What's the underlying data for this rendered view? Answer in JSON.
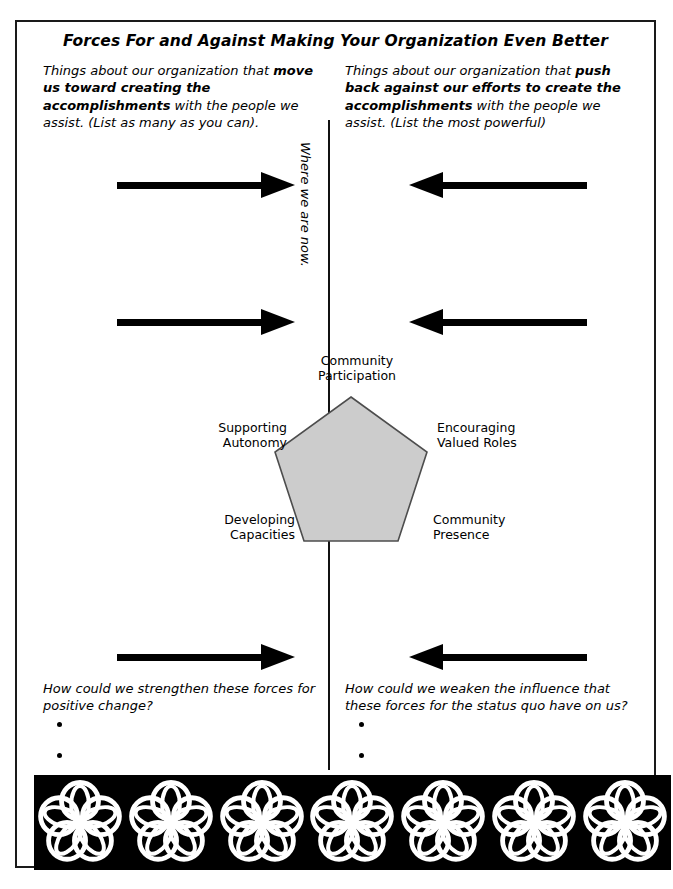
{
  "page": {
    "title": "Forces For and Against Making Your Organization Even Better"
  },
  "columns": {
    "left": {
      "text_1": "Things about our organization that ",
      "bold_1": "move us toward creating the accomplishments",
      "text_2": " with the people we assist. (List as many as you can)."
    },
    "right": {
      "text_1": "Things about our organization that ",
      "bold_1": "push back against our efforts to create the accomplishments",
      "text_2": " with the people we assist. (List the most powerful)"
    }
  },
  "divider": {
    "label": "Where we are now."
  },
  "arrows": [
    {
      "name": "force-for-arrow-1",
      "direction": "right"
    },
    {
      "name": "force-against-arrow-1",
      "direction": "left"
    },
    {
      "name": "force-for-arrow-2",
      "direction": "right"
    },
    {
      "name": "force-against-arrow-2",
      "direction": "left"
    },
    {
      "name": "force-for-arrow-3",
      "direction": "right"
    },
    {
      "name": "force-against-arrow-3",
      "direction": "left"
    }
  ],
  "pentagon": {
    "fill_color": "#cccccc",
    "stroke_color": "#4d4d4d",
    "labels": {
      "top": "Community\nParticipation",
      "top_line1": "Community",
      "top_line2": "Participation",
      "right_line1": "Encouraging",
      "right_line2": "Valued Roles",
      "left_line1": "Supporting",
      "left_line2": "Autonomy",
      "bottom_left_line1": "Developing",
      "bottom_left_line2": "Capacities",
      "bottom_right_line1": "Community",
      "bottom_right_line2": "Presence"
    }
  },
  "questions": {
    "left": "How could we strengthen these forces for positive change?",
    "right": "How could we weaken the influence that these forces for the status quo have on us?",
    "bullet_count": 3
  },
  "border_band": {
    "background_color": "#000000",
    "motif_color": "#ffffff",
    "motif_name": "five-petal-rosette",
    "motif_count": 7
  }
}
